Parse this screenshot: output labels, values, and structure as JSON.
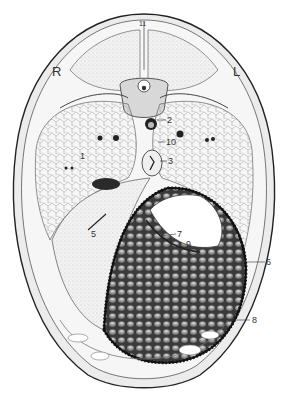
{
  "figure": {
    "type": "anatomical cross-section illustration",
    "orientation": {
      "left": "R",
      "right": "L"
    },
    "labels": [
      {
        "id": "1",
        "x": 80,
        "y": 152
      },
      {
        "id": "2",
        "x": 167,
        "y": 118
      },
      {
        "id": "3",
        "x": 168,
        "y": 158
      },
      {
        "id": "5",
        "x": 91,
        "y": 232
      },
      {
        "id": "6",
        "x": 266,
        "y": 258
      },
      {
        "id": "7",
        "x": 177,
        "y": 232
      },
      {
        "id": "8",
        "x": 252,
        "y": 316
      },
      {
        "id": "9",
        "x": 186,
        "y": 240
      },
      {
        "id": "10",
        "x": 166,
        "y": 139
      },
      {
        "id": "11",
        "x": 140,
        "y": 20
      }
    ]
  }
}
